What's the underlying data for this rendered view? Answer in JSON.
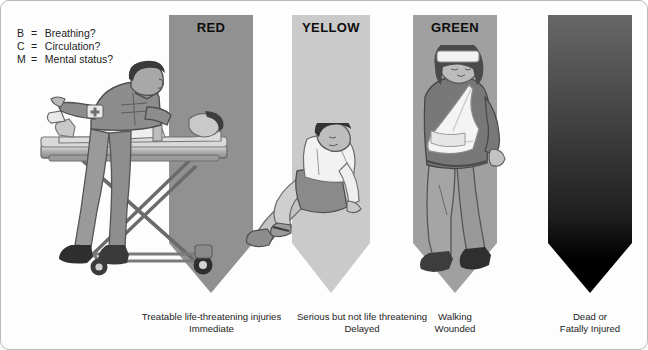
{
  "figure": {
    "legend": [
      {
        "key": "B",
        "eq": "=",
        "text": "Breathing?"
      },
      {
        "key": "C",
        "eq": "=",
        "text": "Circulation?"
      },
      {
        "key": "M",
        "eq": "=",
        "text": "Mental status?"
      }
    ],
    "banners": [
      {
        "label": "RED",
        "color": "#919191"
      },
      {
        "label": "YELLOW",
        "color": "#cacaca"
      },
      {
        "label": "GREEN",
        "color": "#a0a0a0"
      },
      {
        "label": "",
        "color": "#000000"
      }
    ],
    "captions": [
      {
        "line1": "Treatable life-threatening injuries",
        "line2": "Immediate"
      },
      {
        "line1": "Serious but not life threatening",
        "line2": "Delayed"
      },
      {
        "line1": "Walking",
        "line2": "Wounded"
      },
      {
        "line1": "Dead or",
        "line2": "Fatally Injured"
      }
    ],
    "illustrations": [
      {
        "name": "paramedic-with-patient-on-stretcher"
      },
      {
        "name": "seated-injured-man"
      },
      {
        "name": "standing-woman-with-arm-sling"
      }
    ]
  }
}
